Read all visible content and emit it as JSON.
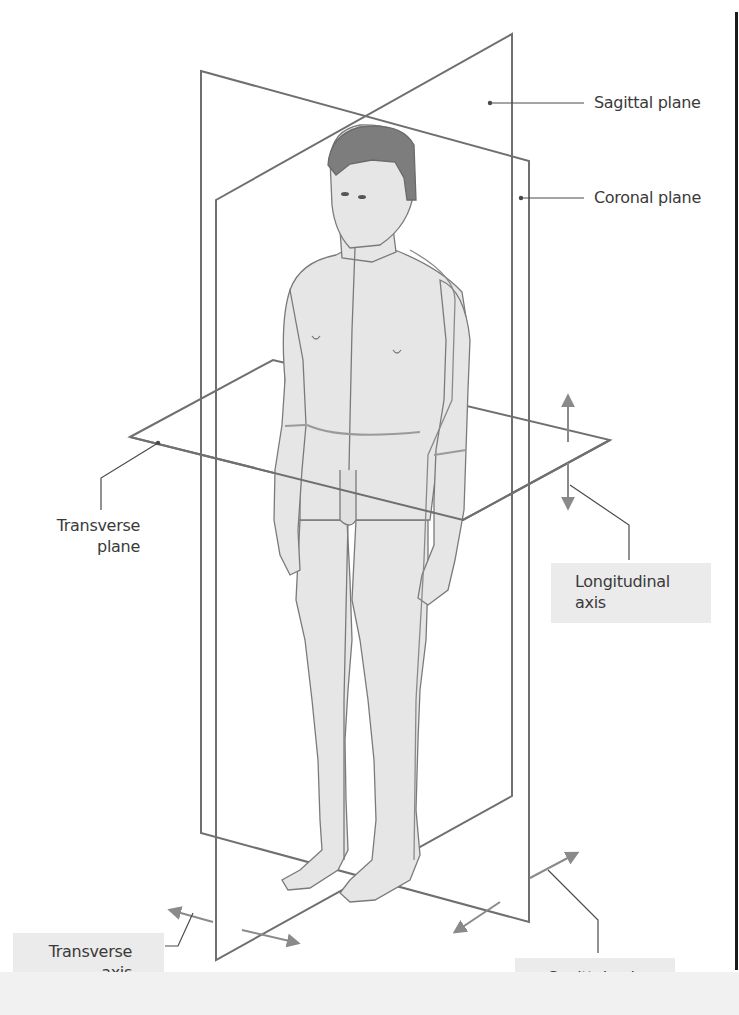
{
  "figure": {
    "type": "anatomical-planes-and-axes",
    "colors": {
      "plane_line": "#6f6f6f",
      "axis_arrow": "#8a8a8a",
      "leader_line": "#4a4a4a",
      "skin": "#e6e6e6",
      "skin_outline": "#7a7a7a",
      "hair": "#7d7d7d",
      "label_box": "#ebebeb",
      "label_text": "#3a3a3a"
    }
  },
  "labels": {
    "sagittal_plane": "Sagittal plane",
    "coronal_plane": "Coronal plane",
    "transverse_plane_line1": "Transverse",
    "transverse_plane_line2": "plane",
    "longitudinal_axis_line1": "Longitudinal",
    "longitudinal_axis_line2": "axis",
    "transverse_axis_line1": "Transverse",
    "transverse_axis_line2": "axis",
    "sagittal_axis": "Sagittal axis"
  }
}
